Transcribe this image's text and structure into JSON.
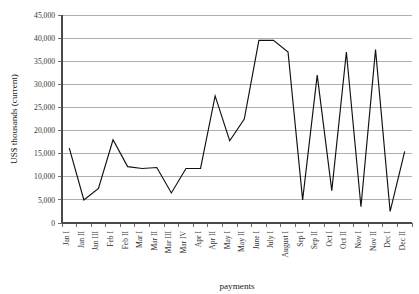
{
  "chart_data": {
    "type": "line",
    "title": "",
    "xlabel": "payments",
    "ylabel": "US$ thousands (current)",
    "ylim": [
      0,
      45000
    ],
    "ytick_labels": [
      "0",
      "5,000",
      "10,000",
      "15,000",
      "20,000",
      "25,000",
      "30,000",
      "35,000",
      "40,000",
      "45,000"
    ],
    "ytick_values": [
      0,
      5000,
      10000,
      15000,
      20000,
      25000,
      30000,
      35000,
      40000,
      45000
    ],
    "grid": true,
    "legend": "none",
    "categories": [
      "Jan I",
      "Jan II",
      "Jan III",
      "Feb I",
      "Feb II",
      "Mar I",
      "Mar II",
      "Mar III",
      "Mar IV",
      "Apr I",
      "Apr II",
      "May I",
      "May II",
      "June I",
      "July I",
      "August I",
      "Sep I",
      "Sep II",
      "Oct I",
      "Oct II",
      "Nov I",
      "Nov II",
      "Dec I",
      "Dec II"
    ],
    "values": [
      16200,
      5000,
      7500,
      18000,
      12200,
      11800,
      12000,
      6500,
      11800,
      11800,
      27500,
      17800,
      22500,
      39500,
      39500,
      37000,
      5000,
      32000,
      7000,
      37000,
      3500,
      37500,
      2500,
      15500
    ],
    "series_name": "payments"
  },
  "figure": {
    "background_color": "#ffffff",
    "line_color": "#111111",
    "grid_color": "#8d8d8d",
    "axis_color": "#4a4a4a"
  }
}
